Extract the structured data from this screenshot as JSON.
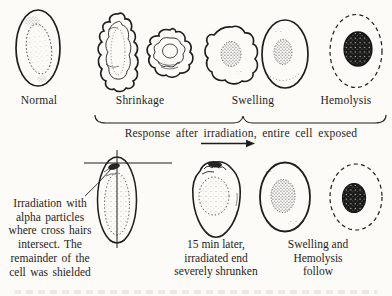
{
  "figure": {
    "type": "textbook-cell-irradiation-diagram",
    "palette": {
      "background": "#fcfbf8",
      "ink": "#1e1e1c"
    },
    "top_row": {
      "labels": [
        "Normal",
        "Shrinkage",
        "Swelling",
        "Hemolysis"
      ]
    },
    "exposure_caption": "Response after irradiation, entire cell exposed",
    "annotations": {
      "shielded": {
        "lines": [
          "Irradiation with",
          "alpha particles",
          "where cross hairs",
          "intersect. The",
          "remainder of the",
          "cell was shielded"
        ]
      },
      "shrunken": {
        "lines": [
          "15 min later,",
          "irradiated end",
          "severely shrunken"
        ]
      },
      "follow": {
        "lines": [
          "Swelling and",
          "Hemolysis",
          "follow"
        ]
      }
    }
  }
}
